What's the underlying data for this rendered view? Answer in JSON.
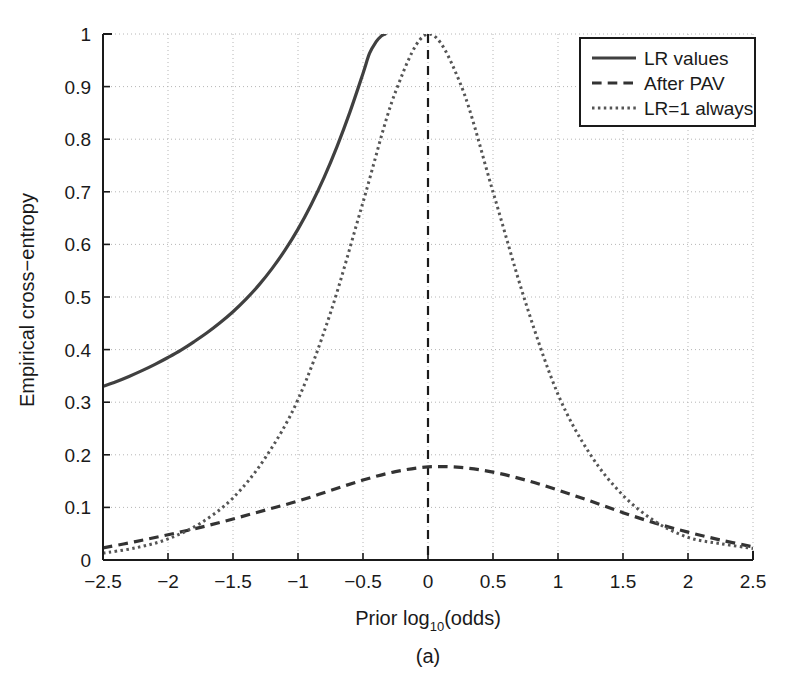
{
  "figure": {
    "caption": "(a)",
    "background": "#ffffff",
    "foreground": "#1a1a1a"
  },
  "chart_data": {
    "type": "line",
    "title": "",
    "xlabel_prefix": "Prior log",
    "xlabel_sub": "10",
    "xlabel_suffix": "(odds)",
    "xlabel": "Prior log10(odds)",
    "ylabel": "Empirical cross−entropy",
    "xlim": [
      -2.5,
      2.5
    ],
    "ylim": [
      0,
      1
    ],
    "xticks": [
      -2.5,
      -2,
      -1.5,
      -1,
      -0.5,
      0,
      0.5,
      1,
      1.5,
      2,
      2.5
    ],
    "xticklabels": [
      "−2.5",
      "−2",
      "−1.5",
      "−1",
      "−0.5",
      "0",
      "0.5",
      "1",
      "1.5",
      "2",
      "2.5"
    ],
    "yticks": [
      0,
      0.1,
      0.2,
      0.3,
      0.4,
      0.5,
      0.6,
      0.7,
      0.8,
      0.9,
      1
    ],
    "yticklabels": [
      "0",
      "0.1",
      "0.2",
      "0.3",
      "0.4",
      "0.5",
      "0.6",
      "0.7",
      "0.8",
      "0.9",
      "1"
    ],
    "grid": true,
    "grid_style": "dotted",
    "legend_position": "top-right",
    "reference_line": {
      "name": "prior-zero-line",
      "x": 0,
      "style": "dashed",
      "color": "#1a1a1a"
    },
    "series": [
      {
        "name": "LR values",
        "style": "solid",
        "color": "#404040",
        "width": 3.2,
        "x": [
          -2.5,
          -2.4,
          -2.3,
          -2.2,
          -2.1,
          -2.0,
          -1.9,
          -1.8,
          -1.7,
          -1.6,
          -1.5,
          -1.4,
          -1.3,
          -1.2,
          -1.1,
          -1.0,
          -0.9,
          -0.8,
          -0.7,
          -0.6,
          -0.5,
          -0.45,
          -0.4,
          -0.36,
          -0.33
        ],
        "y": [
          0.33,
          0.339,
          0.349,
          0.36,
          0.372,
          0.385,
          0.399,
          0.415,
          0.432,
          0.451,
          0.472,
          0.496,
          0.523,
          0.554,
          0.589,
          0.629,
          0.675,
          0.727,
          0.786,
          0.852,
          0.925,
          0.963,
          0.985,
          0.996,
          1.0
        ]
      },
      {
        "name": "After PAV",
        "style": "dashed",
        "color": "#333333",
        "width": 3.2,
        "x": [
          -2.5,
          -2.25,
          -2.0,
          -1.75,
          -1.5,
          -1.25,
          -1.0,
          -0.75,
          -0.5,
          -0.25,
          0,
          0.25,
          0.5,
          0.75,
          1.0,
          1.25,
          1.5,
          1.75,
          2.0,
          2.25,
          2.5
        ],
        "y": [
          0.023,
          0.035,
          0.048,
          0.062,
          0.078,
          0.095,
          0.112,
          0.132,
          0.152,
          0.168,
          0.177,
          0.176,
          0.167,
          0.152,
          0.133,
          0.112,
          0.09,
          0.07,
          0.053,
          0.038,
          0.025
        ]
      },
      {
        "name": "LR=1 always",
        "style": "dotted",
        "color": "#555555",
        "width": 3.0,
        "x": [
          -2.5,
          -2.25,
          -2.0,
          -1.75,
          -1.5,
          -1.25,
          -1.0,
          -0.75,
          -0.5,
          -0.25,
          0,
          0.25,
          0.5,
          0.75,
          1.0,
          1.25,
          1.5,
          1.75,
          2.0,
          2.25,
          2.5
        ],
        "y": [
          0.013,
          0.023,
          0.04,
          0.07,
          0.118,
          0.195,
          0.305,
          0.47,
          0.68,
          0.89,
          1.0,
          0.905,
          0.7,
          0.49,
          0.315,
          0.2,
          0.123,
          0.073,
          0.043,
          0.031,
          0.022
        ]
      }
    ],
    "legend": [
      {
        "label": "LR values",
        "style": "solid"
      },
      {
        "label": "After PAV",
        "style": "dashed"
      },
      {
        "label": "LR=1 always",
        "style": "dotted"
      }
    ]
  }
}
